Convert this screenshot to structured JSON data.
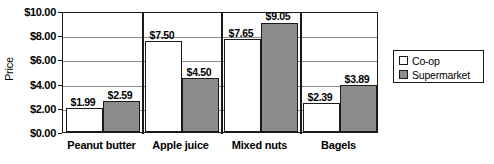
{
  "chart_data": {
    "type": "bar",
    "title": "",
    "xlabel": "",
    "ylabel": "Price",
    "categories": [
      "Peanut butter",
      "Apple juice",
      "Mixed nuts",
      "Bagels"
    ],
    "series": [
      {
        "name": "Co-op",
        "color": "#ffffff",
        "values": [
          1.99,
          7.5,
          7.65,
          2.39
        ],
        "labels": [
          "$1.99",
          "$7.50",
          "$7.65",
          "$2.39"
        ]
      },
      {
        "name": "Supermarket",
        "color": "#8c8c8c",
        "values": [
          2.59,
          4.5,
          9.05,
          3.89
        ],
        "labels": [
          "$2.59",
          "$4.50",
          "$9.05",
          "$3.89"
        ]
      }
    ],
    "ylim": [
      0,
      10
    ],
    "ytick_values": [
      0,
      2,
      4,
      6,
      8,
      10
    ],
    "ytick_labels": [
      "$0.00",
      "$2.00",
      "$4.00",
      "$6.00",
      "$8.00",
      "$10.00"
    ],
    "grid": true,
    "legend_position": "right"
  },
  "axis": {
    "y_title": "Price"
  },
  "legend": {
    "entries": [
      {
        "label": "Co-op"
      },
      {
        "label": "Supermarket"
      }
    ]
  }
}
